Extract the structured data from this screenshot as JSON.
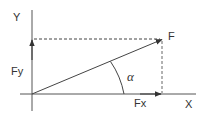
{
  "diagram": {
    "labels": {
      "y_axis": "Y",
      "x_axis": "X",
      "force": "F",
      "fy": "Fy",
      "fx": "Fx",
      "angle": "α"
    },
    "colors": {
      "line": "#333333",
      "background": "#ffffff"
    },
    "geometry": {
      "origin": [
        32,
        94
      ],
      "force_tip": [
        163,
        39
      ],
      "fx_tip": [
        162,
        94
      ],
      "fy_tip": [
        32,
        39
      ]
    }
  }
}
